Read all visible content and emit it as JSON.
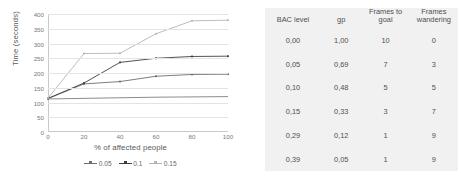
{
  "chart_data": {
    "type": "line",
    "title": "",
    "xlabel": "% of affected people",
    "ylabel": "Time (seconds)",
    "x": [
      0,
      20,
      40,
      60,
      80,
      100
    ],
    "xlim": [
      0,
      100
    ],
    "ylim": [
      0,
      400
    ],
    "ytick_labels": [
      "400",
      "350",
      "300",
      "250",
      "200",
      "150",
      "100",
      "50",
      "0"
    ],
    "xtick_labels": [
      "0",
      "20",
      "40",
      "60",
      "80",
      "100"
    ],
    "grid": true,
    "legend_position": "bottom",
    "series": [
      {
        "name": "baseline",
        "in_legend": false,
        "color": "#808080",
        "values": [
          112,
          114,
          116,
          118,
          119,
          120
        ]
      },
      {
        "name": "0.05",
        "in_legend": true,
        "color": "#6e6e6e",
        "values": [
          113,
          163,
          171,
          189,
          195,
          196
        ]
      },
      {
        "name": "0.1",
        "in_legend": true,
        "color": "#3f3f3f",
        "values": [
          114,
          166,
          236,
          250,
          256,
          257
        ]
      },
      {
        "name": "0.15",
        "in_legend": true,
        "color": "#b5b5b5",
        "values": [
          115,
          266,
          267,
          333,
          377,
          379
        ]
      }
    ],
    "legend": [
      "0.05",
      "0.1",
      "0.15"
    ]
  },
  "table": {
    "headers": [
      "BAC level",
      "gp",
      "Frames to goal",
      "Frames wandering"
    ],
    "header_lines": [
      [
        "BAC level"
      ],
      [
        "gp"
      ],
      [
        "Frames to",
        "goal"
      ],
      [
        "Frames",
        "wandering"
      ]
    ],
    "rows": [
      {
        "bac": "0,00",
        "gp": "1,00",
        "frames_to_goal": "10",
        "frames_wandering": "0"
      },
      {
        "bac": "0,05",
        "gp": "0,69",
        "frames_to_goal": "7",
        "frames_wandering": "3"
      },
      {
        "bac": "0,10",
        "gp": "0,48",
        "frames_to_goal": "5",
        "frames_wandering": "5"
      },
      {
        "bac": "0,15",
        "gp": "0,33",
        "frames_to_goal": "3",
        "frames_wandering": "7"
      },
      {
        "bac": "0,29",
        "gp": "0,12",
        "frames_to_goal": "1",
        "frames_wandering": "9"
      },
      {
        "bac": "0,39",
        "gp": "0,05",
        "frames_to_goal": "1",
        "frames_wandering": "9"
      }
    ],
    "background": "#f1f1f1"
  }
}
